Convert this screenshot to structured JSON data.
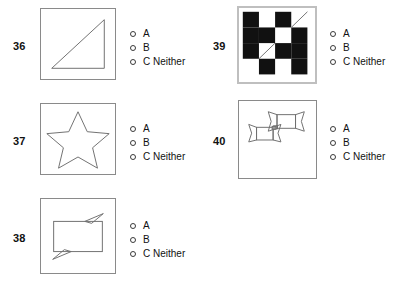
{
  "page": {
    "background_color": "#ffffff",
    "text_color": "#111111",
    "box_border_color": "#8a8a8a",
    "box_border_color_emphasis": "#bfbfbf",
    "shape_stroke_color": "#6f6f6f",
    "checker_dark_color": "#111111",
    "checker_light_color": "#ffffff"
  },
  "options_template": [
    {
      "letter": "A",
      "label": "A"
    },
    {
      "letter": "B",
      "label": "B"
    },
    {
      "letter": "C",
      "label": "C Neither"
    }
  ],
  "questions": [
    {
      "number": "36",
      "figure": "right-triangle",
      "options": [
        {
          "label": "A",
          "selected": false
        },
        {
          "label": "B",
          "selected": false
        },
        {
          "label": "C Neither",
          "selected": false
        }
      ]
    },
    {
      "number": "37",
      "figure": "five-pointed-star",
      "options": [
        {
          "label": "A",
          "selected": false
        },
        {
          "label": "B",
          "selected": false
        },
        {
          "label": "C Neither",
          "selected": false
        }
      ]
    },
    {
      "number": "38",
      "figure": "rectangle-with-tabs",
      "options": [
        {
          "label": "A",
          "selected": false
        },
        {
          "label": "B",
          "selected": false
        },
        {
          "label": "C Neither",
          "selected": false
        }
      ]
    },
    {
      "number": "39",
      "figure": "checkerboard-with-diagonals",
      "options": [
        {
          "label": "A",
          "selected": false
        },
        {
          "label": "B",
          "selected": false
        },
        {
          "label": "C Neither",
          "selected": false
        }
      ]
    },
    {
      "number": "40",
      "figure": "two-ribbon-banners",
      "options": [
        {
          "label": "A",
          "selected": false
        },
        {
          "label": "B",
          "selected": false
        },
        {
          "label": "C Neither",
          "selected": false
        }
      ]
    }
  ]
}
